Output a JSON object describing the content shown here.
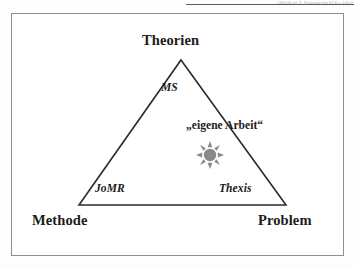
{
  "page": {
    "running_head": "Abbildung 2: Spannungsfeld der Arbeit"
  },
  "figure": {
    "diagram_type": "triangle-model",
    "corners": [
      {
        "id": "theorien",
        "label": "Theorien",
        "position": "top"
      },
      {
        "id": "methode",
        "label": "Methode",
        "position": "bottom-left"
      },
      {
        "id": "problem",
        "label": "Problem",
        "position": "bottom-right"
      }
    ],
    "edges": [
      {
        "id": "ms",
        "label": "MS",
        "position": "upper-left-edge"
      },
      {
        "id": "jomr",
        "label": "JoMR",
        "position": "bottom-left-inner"
      },
      {
        "id": "thexis",
        "label": "Thexis",
        "position": "bottom-right-inner"
      }
    ],
    "annotation": {
      "id": "eigene-arbeit",
      "label": "„eigene Arbeit“"
    },
    "marker": {
      "id": "sun-marker",
      "icon": "sun-icon",
      "rays": 8,
      "color": "#8a8a8a"
    },
    "colors": {
      "stroke": "#2b2b2b",
      "frame": "#8e8e8e",
      "text": "#1b1b1b",
      "marker": "#8a8a8a",
      "background": "#ffffff"
    },
    "geometry": {
      "apex": {
        "x": 181,
        "y": 60
      },
      "bottom_left": {
        "x": 79,
        "y": 205
      },
      "bottom_right": {
        "x": 286,
        "y": 205
      }
    }
  }
}
